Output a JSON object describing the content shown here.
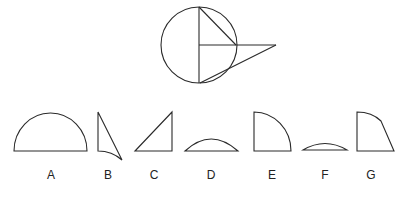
{
  "options": [
    {
      "label": "A",
      "shape": "semicircle"
    },
    {
      "label": "B",
      "shape": "thin triangle with concave curved base"
    },
    {
      "label": "C",
      "shape": "right triangle"
    },
    {
      "label": "D",
      "shape": "circular segment (medium)"
    },
    {
      "label": "E",
      "shape": "quarter circle"
    },
    {
      "label": "F",
      "shape": "circular segment (thin)"
    },
    {
      "label": "G",
      "shape": "quarter circle with cut corner"
    }
  ],
  "colors": {
    "stroke": "#2a2a2a",
    "background": "#ffffff"
  }
}
